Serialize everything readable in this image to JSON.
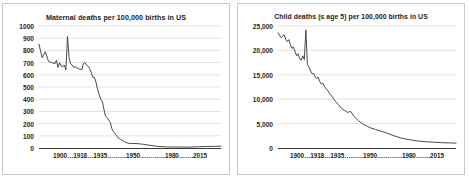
{
  "figure": {
    "panels": [
      "maternal",
      "child"
    ]
  },
  "charts": [
    {
      "id": "maternal",
      "title": "Maternal deaths per 100,000 births in US",
      "xaxis_label": "1900…1918…1935………1950…………1980…….2015",
      "yticks": [
        "1000",
        "900",
        "800",
        "700",
        "600",
        "500",
        "400",
        "300",
        "200",
        "100",
        "0"
      ]
    },
    {
      "id": "child",
      "title": "Child deaths (≤ age 5) per 100,000 births in US",
      "xaxis_label": "1900…1918…1935………1950…………1980…….2015",
      "yticks": [
        "25,000",
        "20,000",
        "15,000",
        "10,000",
        "5,000",
        "0"
      ]
    }
  ],
  "chart_data": [
    {
      "type": "line",
      "title": "Maternal deaths per 100,000 births in US",
      "xlabel": "1900...1918...1935.........1950..........1980.......2015",
      "ylabel": "",
      "xlim": [
        1900,
        2015
      ],
      "ylim": [
        0,
        1000
      ],
      "ytick_values": [
        0,
        100,
        200,
        300,
        400,
        500,
        600,
        700,
        800,
        900,
        1000
      ],
      "xtick_values": [
        1900,
        1918,
        1935,
        1950,
        1980,
        2015
      ],
      "grid": true,
      "legend": false,
      "line_color": "#4a4a4a",
      "series": [
        {
          "name": "Maternal deaths per 100,000 births",
          "x": [
            1900,
            1902,
            1904,
            1906,
            1908,
            1910,
            1911,
            1912,
            1913,
            1914,
            1915,
            1916,
            1917,
            1918,
            1919,
            1920,
            1921,
            1922,
            1923,
            1924,
            1925,
            1926,
            1927,
            1928,
            1929,
            1930,
            1931,
            1932,
            1933,
            1934,
            1935,
            1936,
            1937,
            1938,
            1939,
            1940,
            1941,
            1942,
            1943,
            1944,
            1945,
            1946,
            1947,
            1948,
            1949,
            1950,
            1952,
            1954,
            1956,
            1958,
            1960,
            1963,
            1966,
            1970,
            1975,
            1980,
            1985,
            1990,
            1995,
            2000,
            2005,
            2010,
            2015
          ],
          "y": [
            850,
            740,
            790,
            710,
            700,
            690,
            720,
            660,
            700,
            670,
            665,
            680,
            640,
            915,
            740,
            690,
            680,
            660,
            665,
            655,
            650,
            645,
            640,
            690,
            700,
            680,
            670,
            650,
            620,
            580,
            580,
            540,
            480,
            440,
            400,
            380,
            320,
            260,
            250,
            230,
            210,
            160,
            135,
            120,
            100,
            83,
            68,
            52,
            40,
            37,
            37,
            35,
            30,
            22,
            13,
            9,
            8,
            8,
            7,
            10,
            12,
            13,
            15
          ]
        }
      ]
    },
    {
      "type": "line",
      "title": "Child deaths (≤ age 5) per 100,000 births in US",
      "xlabel": "1900...1918...1935.........1950..........1980.......2015",
      "ylabel": "",
      "xlim": [
        1900,
        2015
      ],
      "ylim": [
        0,
        25000
      ],
      "ytick_values": [
        0,
        5000,
        10000,
        15000,
        20000,
        25000
      ],
      "xtick_values": [
        1900,
        1918,
        1935,
        1950,
        1980,
        2015
      ],
      "grid": true,
      "legend": false,
      "line_color": "#4a4a4a",
      "series": [
        {
          "name": "Child deaths (≤ age 5) per 100,000 births",
          "x": [
            1900,
            1902,
            1904,
            1905,
            1906,
            1907,
            1908,
            1909,
            1910,
            1911,
            1912,
            1913,
            1914,
            1915,
            1916,
            1917,
            1918,
            1919,
            1920,
            1921,
            1922,
            1923,
            1924,
            1925,
            1926,
            1927,
            1928,
            1929,
            1930,
            1932,
            1934,
            1935,
            1937,
            1939,
            1941,
            1943,
            1945,
            1947,
            1949,
            1950,
            1952,
            1954,
            1956,
            1958,
            1960,
            1963,
            1966,
            1970,
            1975,
            1980,
            1985,
            1990,
            1995,
            2000,
            2005,
            2010,
            2015
          ],
          "y": [
            23600,
            22600,
            23200,
            22300,
            21800,
            22200,
            21200,
            20400,
            20700,
            19800,
            18900,
            19300,
            18300,
            18000,
            18900,
            18100,
            24200,
            17100,
            16600,
            15800,
            15200,
            15300,
            14600,
            14200,
            14500,
            13600,
            13100,
            13300,
            12600,
            11800,
            10900,
            10500,
            9600,
            8900,
            8100,
            7700,
            7300,
            7500,
            6500,
            6200,
            5600,
            5100,
            4700,
            4400,
            4100,
            3800,
            3500,
            3100,
            2500,
            2000,
            1700,
            1450,
            1300,
            1200,
            1100,
            1050,
            1000
          ]
        }
      ]
    }
  ]
}
